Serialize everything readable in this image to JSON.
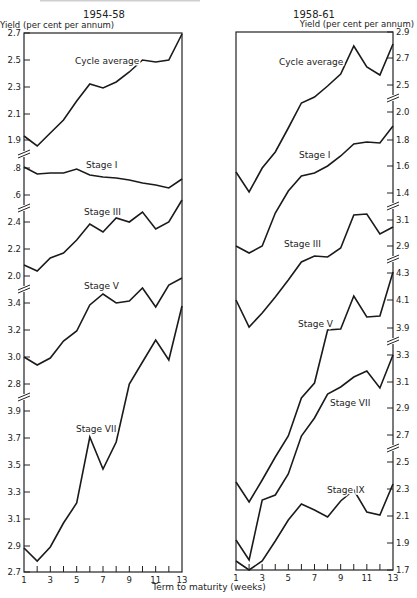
{
  "figure": {
    "xlabel": "Term to maturity (weeks)",
    "x_ticks": [
      "1",
      "3",
      "5",
      "7",
      "9",
      "11",
      "13"
    ]
  },
  "chart_data": [
    {
      "type": "line",
      "title": "1954-58",
      "ylabel": "Yield (per cent per annum)",
      "xlabel": "Term to maturity (weeks)",
      "x": [
        1,
        2,
        3,
        4,
        5,
        6,
        7,
        8,
        9,
        10,
        11,
        12,
        13
      ],
      "grid": false,
      "legend": "none (series labelled inline)",
      "y_axis_side": "left",
      "y_tick_groups": [
        {
          "ticks": [
            "2.7",
            "2.5",
            "2.3",
            "2.1",
            "1.9"
          ],
          "range": [
            1.9,
            2.7
          ]
        },
        {
          "ticks": [
            ".8",
            ".6"
          ],
          "range": [
            0.6,
            0.8
          ]
        },
        {
          "ticks": [
            "2.4",
            "2.2",
            "2.0"
          ],
          "range": [
            2.0,
            2.4
          ]
        },
        {
          "ticks": [
            "3.4",
            "3.2",
            "3.0",
            "2.8"
          ],
          "range": [
            2.8,
            3.4
          ]
        },
        {
          "ticks": [
            "3.9",
            "3.7",
            "3.5",
            "3.3",
            "3.1",
            "2.9",
            "2.7"
          ],
          "range": [
            2.7,
            3.9
          ]
        }
      ],
      "series": [
        {
          "name": "Cycle average",
          "values": [
            1.93,
            1.86,
            1.96,
            2.05,
            2.19,
            2.32,
            2.29,
            2.33,
            2.41,
            2.5,
            2.49,
            2.51,
            2.7
          ]
        },
        {
          "name": "Stage I",
          "values": [
            0.81,
            0.76,
            0.77,
            0.77,
            0.8,
            0.75,
            0.73,
            0.72,
            0.71,
            0.68,
            0.66,
            0.64,
            0.72
          ]
        },
        {
          "name": "Stage III",
          "values": [
            2.08,
            2.03,
            2.13,
            2.17,
            2.26,
            2.38,
            2.33,
            2.43,
            2.4,
            2.47,
            2.34,
            2.4,
            2.56
          ]
        },
        {
          "name": "Stage V",
          "values": [
            3.0,
            2.94,
            2.99,
            3.12,
            3.19,
            3.38,
            3.47,
            3.4,
            3.42,
            3.52,
            3.37,
            3.54,
            3.59
          ]
        },
        {
          "name": "Stage VII",
          "values": [
            2.86,
            2.76,
            2.87,
            3.05,
            3.34,
            3.72,
            3.47,
            3.66,
            4.12,
            4.28,
            4.44,
            4.3,
            4.7
          ]
        }
      ]
    },
    {
      "type": "line",
      "title": "1958-61",
      "ylabel": "Yield (per cent per annum)",
      "xlabel": "Term to maturity (weeks)",
      "x": [
        1,
        2,
        3,
        4,
        5,
        6,
        7,
        8,
        9,
        10,
        11,
        12,
        13
      ],
      "grid": false,
      "legend": "none (series labelled inline)",
      "y_axis_side": "right",
      "y_tick_groups": [
        {
          "ticks": [
            "2.9",
            "2.7",
            "2.5"
          ],
          "range": [
            2.5,
            2.9
          ]
        },
        {
          "ticks": [
            "2.0",
            "1.8",
            "1.6",
            "1.4"
          ],
          "range": [
            1.4,
            2.0
          ]
        },
        {
          "ticks": [
            "3.1",
            "2.9"
          ],
          "range": [
            2.9,
            3.1
          ]
        },
        {
          "ticks": [
            "4.3",
            "4.1",
            "3.9"
          ],
          "range": [
            3.9,
            4.3
          ]
        },
        {
          "ticks": [
            "3.3",
            "3.1",
            "2.9",
            "2.7"
          ],
          "range": [
            2.7,
            3.3
          ]
        },
        {
          "ticks": [
            "2.5",
            "2.3",
            "2.1",
            "1.9",
            "1.7"
          ],
          "range": [
            1.7,
            2.5
          ]
        }
      ],
      "series": [
        {
          "name": "Cycle average",
          "values": [
            2.1,
            1.95,
            2.13,
            2.25,
            2.43,
            2.61,
            2.66,
            2.74,
            2.83,
            3.04,
            2.88,
            2.82,
            3.05
          ]
        },
        {
          "name": "Stage I",
          "values": [
            1.56,
            1.41,
            1.59,
            1.74,
            1.9,
            2.02,
            2.05,
            2.1,
            2.18,
            2.27,
            2.28,
            2.27,
            2.4
          ]
        },
        {
          "name": "Stage III",
          "values": [
            2.86,
            2.84,
            2.88,
            3.0,
            3.08,
            3.12,
            3.11,
            3.15,
            3.23,
            3.25,
            3.1,
            3.0,
            3.06
          ]
        },
        {
          "name": "Stage V",
          "values": [
            4.08,
            3.93,
            4.03,
            4.15,
            4.27,
            4.4,
            4.52,
            4.58,
            4.91,
            4.92,
            5.15,
            5.0,
            5.01
          ]
        },
        {
          "name": "Stage VII",
          "values": [
            2.38,
            2.22,
            2.45,
            2.58,
            2.78,
            3.0,
            3.08,
            3.26,
            3.28,
            3.3,
            3.19,
            3.06,
            3.3
          ]
        },
        {
          "name": "Stage IX",
          "values": [
            1.93,
            1.76,
            2.22,
            2.26,
            2.43,
            2.7,
            2.86,
            3.03,
            3.08,
            3.15,
            3.19,
            3.05,
            3.31
          ]
        }
      ]
    }
  ],
  "render": {
    "panels": [
      {
        "title_xy": [
          104,
          18
        ],
        "frame": {
          "x0": 24,
          "x1": 182,
          "y0": 33,
          "y1": 572
        },
        "ylabel_xy": [
          0,
          28
        ],
        "ylabel_anchor": "start",
        "tick_side": "left",
        "tick_labels": [
          {
            "t": "2.7",
            "y": 33
          },
          {
            "t": "2.5",
            "y": 60
          },
          {
            "t": "2.3",
            "y": 87
          },
          {
            "t": "2.1",
            "y": 114
          },
          {
            "t": "1.9",
            "y": 140
          },
          {
            "t": ".8",
            "y": 168
          },
          {
            "t": ".6",
            "y": 195
          },
          {
            "t": "2.4",
            "y": 222
          },
          {
            "t": "2.2",
            "y": 249
          },
          {
            "t": "2.0",
            "y": 276
          },
          {
            "t": "3.4",
            "y": 303
          },
          {
            "t": "3.2",
            "y": 330
          },
          {
            "t": "3.0",
            "y": 357
          },
          {
            "t": "2.8",
            "y": 384
          },
          {
            "t": "3.9",
            "y": 411
          },
          {
            "t": "3.7",
            "y": 438
          },
          {
            "t": "3.5",
            "y": 465
          },
          {
            "t": "3.3",
            "y": 492
          },
          {
            "t": "3.1",
            "y": 519
          },
          {
            "t": "2.9",
            "y": 546
          },
          {
            "t": "2.7",
            "y": 572
          }
        ],
        "breaks": [
          154,
          208,
          289,
          397
        ],
        "series_px": [
          {
            "name": "Cycle average",
            "label_xy": [
              75,
              64
            ],
            "pts": [
              136,
              146,
              133,
              120,
              101,
              84,
              88,
              82,
              72,
              60,
              62,
              60,
              34
            ]
          },
          {
            "name": "Stage I",
            "label_xy": [
              86,
              168
            ],
            "pts": [
              167,
              174,
              173,
              173,
              169,
              175,
              177,
              178,
              180,
              183,
              185,
              188,
              179
            ]
          },
          {
            "name": "Stage III",
            "label_xy": [
              84,
              215
            ],
            "pts": [
              265,
              271,
              258,
              253,
              240,
              224,
              232,
              218,
              222,
              212,
              229,
              222,
              200
            ]
          },
          {
            "name": "Stage V",
            "label_xy": [
              84,
              289
            ],
            "pts": [
              357,
              365,
              358,
              341,
              331,
              305,
              294,
              303,
              301,
              288,
              307,
              285,
              278
            ]
          },
          {
            "name": "Stage VII",
            "label_xy": [
              76,
              432
            ],
            "pts": [
              548,
              561,
              547,
              523,
              503,
              437,
              469,
              442,
              384,
              362,
              340,
              360,
              306
            ]
          }
        ]
      },
      {
        "title_xy": [
          314,
          18
        ],
        "frame": {
          "x0": 236,
          "x1": 393,
          "y0": 32,
          "y1": 570
        },
        "ylabel_xy": [
          414,
          27
        ],
        "ylabel_anchor": "end",
        "tick_side": "right",
        "tick_labels": [
          {
            "t": "2.9",
            "y": 32
          },
          {
            "t": "2.7",
            "y": 58
          },
          {
            "t": "2.5",
            "y": 85
          },
          {
            "t": "2.0",
            "y": 112
          },
          {
            "t": "1.8",
            "y": 140
          },
          {
            "t": "1.6",
            "y": 166
          },
          {
            "t": "1.4",
            "y": 193
          },
          {
            "t": "3.1",
            "y": 220
          },
          {
            "t": "2.9",
            "y": 246
          },
          {
            "t": "4.3",
            "y": 273
          },
          {
            "t": "4.1",
            "y": 300
          },
          {
            "t": "3.9",
            "y": 328
          },
          {
            "t": "3.3",
            "y": 355
          },
          {
            "t": "3.1",
            "y": 382
          },
          {
            "t": "2.9",
            "y": 408
          },
          {
            "t": "2.7",
            "y": 435
          },
          {
            "t": "2.5",
            "y": 462
          },
          {
            "t": "2.3",
            "y": 489
          },
          {
            "t": "2.1",
            "y": 516
          },
          {
            "t": "1.9",
            "y": 543
          },
          {
            "t": "1.7",
            "y": 570
          }
        ],
        "breaks": [
          98,
          206,
          259,
          341,
          448
        ],
        "series_px": [
          {
            "name": "Cycle average",
            "label_xy": [
              279,
              65
            ],
            "pts": [
              172,
              192,
              168,
              152,
              128,
              103,
              97,
              86,
              74,
              46,
              67,
              75,
              44
            ]
          },
          {
            "name": "Stage I",
            "label_xy": [
              299,
              158
            ],
            "pts": [
              246,
              253,
              246,
              213,
              191,
              176,
              173,
              166,
              156,
              144,
              142,
              143,
              126
            ]
          },
          {
            "name": "Stage III",
            "label_xy": [
              284,
              247
            ],
            "pts": [
              300,
              327,
              313,
              297,
              280,
              262,
              256,
              257,
              248,
              215,
              214,
              234,
              227
            ]
          },
          {
            "name": "Stage V",
            "label_xy": [
              298,
              327
            ],
            "pts": [
              482,
              502,
              480,
              457,
              436,
              398,
              383,
              330,
              329,
              296,
              317,
              316,
              272
            ]
          },
          {
            "name": "Stage VII",
            "label_xy": [
              330,
              406
            ],
            "pts": [
              540,
              560,
              500,
              495,
              474,
              436,
              418,
              394,
              387,
              377,
              371,
              388,
              355
            ]
          },
          {
            "name": "Stage IX",
            "label_xy": [
              327,
              493
            ],
            "pts": [
              561,
              570,
              561,
              541,
              520,
              504,
              510,
              517,
              501,
              490,
              512,
              515,
              484
            ]
          }
        ]
      }
    ],
    "xlabel_xy": [
      209,
      590
    ],
    "top_clipped_title": "Cycle average yields by stage and term to maturity"
  }
}
